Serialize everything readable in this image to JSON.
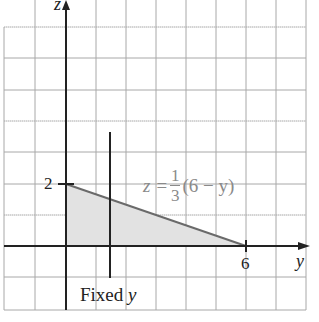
{
  "diagram": {
    "axes": {
      "vertical_label": "z",
      "horizontal_label": "y"
    },
    "ticks": {
      "z_tick": "2",
      "y_tick": "6"
    },
    "boundary_line": {
      "lhs": "z =",
      "frac_num": "1",
      "frac_den": "3",
      "rhs": "(6 − y)",
      "from": [
        0,
        2
      ],
      "to": [
        6,
        0
      ]
    },
    "fixed_line": {
      "label_prefix": "Fixed",
      "label_var": "y",
      "y_value": 1.5
    },
    "region": {
      "description": "triangle between axes and boundary line",
      "vertices": [
        [
          0,
          0
        ],
        [
          0,
          2
        ],
        [
          6,
          0
        ]
      ],
      "fill": "#e4e4e4"
    },
    "colors": {
      "grid": "#9a9a9a",
      "axis": "#222222",
      "boundary": "#6a6a6a",
      "label_gray": "#8a8a8a"
    }
  }
}
